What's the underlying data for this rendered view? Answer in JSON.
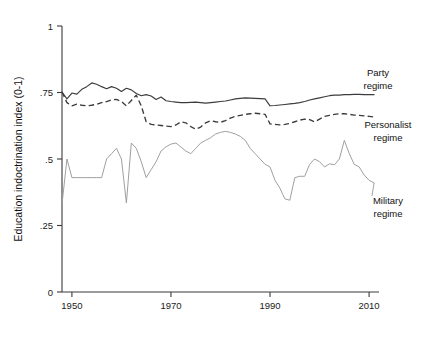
{
  "chart_data": {
    "type": "line",
    "title": "",
    "xlabel": "",
    "ylabel": "Education indoctrination index (0-1)",
    "xlim": [
      1948,
      2012
    ],
    "ylim": [
      0,
      1
    ],
    "xticks": [
      1950,
      1970,
      1990,
      2010
    ],
    "xtick_labels": [
      "1950",
      "1970",
      "1990",
      "2010"
    ],
    "yticks": [
      0,
      0.25,
      0.5,
      0.75,
      1
    ],
    "ytick_labels": [
      "0",
      ".25",
      ".5",
      ".75",
      "1"
    ],
    "grid": false,
    "legend_position": "inline-annotations",
    "series": [
      {
        "name": "Party regime",
        "label": "Party regime",
        "style": "solid",
        "color": "#3c3c3c",
        "x": [
          1948,
          1949,
          1950,
          1951,
          1952,
          1953,
          1954,
          1955,
          1956,
          1957,
          1958,
          1959,
          1960,
          1961,
          1962,
          1963,
          1964,
          1965,
          1966,
          1967,
          1968,
          1969,
          1970,
          1971,
          1972,
          1973,
          1974,
          1975,
          1976,
          1977,
          1978,
          1979,
          1980,
          1981,
          1982,
          1983,
          1984,
          1985,
          1986,
          1987,
          1988,
          1989,
          1990,
          1991,
          1992,
          1993,
          1994,
          1995,
          1996,
          1997,
          1998,
          1999,
          2000,
          2001,
          2002,
          2003,
          2004,
          2005,
          2006,
          2007,
          2008,
          2009,
          2010,
          2011
        ],
        "values": [
          0.752,
          0.726,
          0.748,
          0.744,
          0.762,
          0.772,
          0.786,
          0.781,
          0.772,
          0.764,
          0.772,
          0.766,
          0.754,
          0.766,
          0.76,
          0.746,
          0.738,
          0.742,
          0.737,
          0.724,
          0.733,
          0.719,
          0.716,
          0.714,
          0.712,
          0.712,
          0.713,
          0.714,
          0.712,
          0.71,
          0.712,
          0.714,
          0.716,
          0.718,
          0.722,
          0.726,
          0.728,
          0.73,
          0.729,
          0.728,
          0.727,
          0.726,
          0.7,
          0.701,
          0.703,
          0.705,
          0.707,
          0.709,
          0.712,
          0.716,
          0.722,
          0.726,
          0.73,
          0.734,
          0.738,
          0.74,
          0.74,
          0.742,
          0.742,
          0.743,
          0.743,
          0.742,
          0.742,
          0.742
        ]
      },
      {
        "name": "Personalist regime",
        "label": "Personalist regime",
        "style": "dashed",
        "color": "#3c3c3c",
        "x": [
          1948,
          1949,
          1950,
          1951,
          1952,
          1953,
          1954,
          1955,
          1956,
          1957,
          1958,
          1959,
          1960,
          1961,
          1962,
          1963,
          1964,
          1965,
          1966,
          1967,
          1968,
          1969,
          1970,
          1971,
          1972,
          1973,
          1974,
          1975,
          1976,
          1977,
          1978,
          1979,
          1980,
          1981,
          1982,
          1983,
          1984,
          1985,
          1986,
          1987,
          1988,
          1989,
          1990,
          1991,
          1992,
          1993,
          1994,
          1995,
          1996,
          1997,
          1998,
          1999,
          2000,
          2001,
          2002,
          2003,
          2004,
          2005,
          2006,
          2007,
          2008,
          2009,
          2010,
          2011
        ],
        "values": [
          0.752,
          0.712,
          0.7,
          0.706,
          0.702,
          0.7,
          0.702,
          0.706,
          0.712,
          0.716,
          0.722,
          0.724,
          0.716,
          0.7,
          0.72,
          0.74,
          0.7,
          0.64,
          0.63,
          0.628,
          0.626,
          0.624,
          0.622,
          0.628,
          0.64,
          0.636,
          0.622,
          0.612,
          0.62,
          0.636,
          0.644,
          0.64,
          0.638,
          0.644,
          0.654,
          0.66,
          0.664,
          0.668,
          0.67,
          0.672,
          0.67,
          0.668,
          0.632,
          0.63,
          0.628,
          0.63,
          0.634,
          0.64,
          0.646,
          0.65,
          0.648,
          0.64,
          0.65,
          0.66,
          0.664,
          0.668,
          0.67,
          0.67,
          0.668,
          0.665,
          0.664,
          0.662,
          0.66,
          0.658
        ]
      },
      {
        "name": "Military regime",
        "label": "Military regime",
        "style": "solid-light",
        "color": "#9a9a9a",
        "x": [
          1948,
          1949,
          1950,
          1951,
          1952,
          1953,
          1954,
          1955,
          1956,
          1957,
          1958,
          1959,
          1960,
          1961,
          1962,
          1963,
          1964,
          1965,
          1966,
          1967,
          1968,
          1969,
          1970,
          1971,
          1972,
          1973,
          1974,
          1975,
          1976,
          1977,
          1978,
          1979,
          1980,
          1981,
          1982,
          1983,
          1984,
          1985,
          1986,
          1987,
          1988,
          1989,
          1990,
          1991,
          1992,
          1993,
          1994,
          1995,
          1996,
          1997,
          1998,
          1999,
          2000,
          2001,
          2002,
          2003,
          2004,
          2005,
          2006,
          2007,
          2008,
          2009,
          2010,
          2011
        ],
        "values": [
          0.33,
          0.5,
          0.43,
          0.43,
          0.43,
          0.43,
          0.43,
          0.43,
          0.43,
          0.5,
          0.52,
          0.54,
          0.5,
          0.335,
          0.56,
          0.54,
          0.49,
          0.43,
          0.46,
          0.49,
          0.53,
          0.546,
          0.556,
          0.56,
          0.545,
          0.53,
          0.52,
          0.54,
          0.56,
          0.57,
          0.58,
          0.594,
          0.6,
          0.604,
          0.6,
          0.594,
          0.585,
          0.57,
          0.54,
          0.52,
          0.5,
          0.48,
          0.47,
          0.42,
          0.39,
          0.35,
          0.345,
          0.43,
          0.435,
          0.435,
          0.48,
          0.5,
          0.49,
          0.47,
          0.482,
          0.478,
          0.5,
          0.57,
          0.52,
          0.48,
          0.47,
          0.44,
          0.42,
          0.41
        ]
      }
    ],
    "annotations": [
      {
        "text": "Party regime",
        "series": "Party regime"
      },
      {
        "text": "Personalist regime",
        "series": "Personalist regime"
      },
      {
        "text": "Military regime",
        "series": "Military regime"
      }
    ]
  }
}
